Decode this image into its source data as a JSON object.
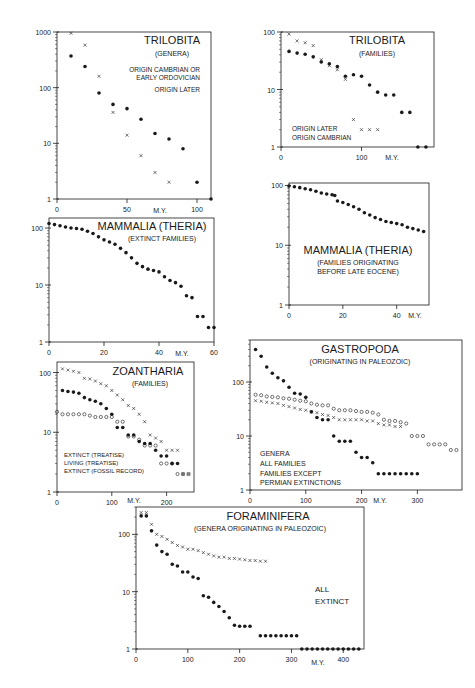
{
  "chart_data": [
    {
      "id": "trilobita-genera",
      "type": "scatter",
      "title": "TRILOBITA",
      "subtitle": "(GENERA)",
      "xlabel": "M.Y.",
      "ylabel": "",
      "yscale": "log",
      "ylim": [
        1,
        1000
      ],
      "xlim": [
        0,
        110
      ],
      "xticks": [
        "0",
        "50",
        "100"
      ],
      "yticks": [
        "1",
        "10",
        "100",
        "1000"
      ],
      "frame": {
        "x": 57,
        "y": 32,
        "w": 154,
        "h": 167
      },
      "legend": [
        {
          "marker": "x",
          "label": "ORIGIN CAMBRIAN OR EARLY ORDOVICIAN"
        },
        {
          "marker": "dot",
          "label": "ORIGIN LATER"
        }
      ],
      "series": [
        {
          "name": "ORIGIN CAMBRIAN OR EARLY ORDOVICIAN",
          "marker": "x",
          "x": [
            10,
            20,
            30,
            40,
            50,
            60,
            70,
            80
          ],
          "y": [
            950,
            580,
            160,
            36,
            14,
            6,
            3,
            2
          ]
        },
        {
          "name": "ORIGIN LATER",
          "marker": "dot",
          "x": [
            10,
            20,
            30,
            40,
            50,
            60,
            70,
            80,
            90,
            100,
            110
          ],
          "y": [
            370,
            240,
            80,
            50,
            42,
            27,
            15,
            12,
            8,
            2,
            1
          ]
        }
      ]
    },
    {
      "id": "trilobita-families",
      "type": "scatter",
      "title": "TRILOBITA",
      "subtitle": "(FAMILIES)",
      "xlabel": "M.Y.",
      "yscale": "log",
      "ylim": [
        1,
        100
      ],
      "xlim": [
        0,
        190
      ],
      "xticks": [
        "0",
        "100"
      ],
      "yticks": [
        "1",
        "10",
        "100"
      ],
      "frame": {
        "x": 281,
        "y": 32,
        "w": 153,
        "h": 115
      },
      "legend": [
        {
          "marker": "dot",
          "label": "ORIGIN LATER"
        },
        {
          "marker": "x",
          "label": "ORIGIN CAMBRIAN"
        }
      ],
      "series": [
        {
          "name": "ORIGIN LATER",
          "marker": "dot",
          "x": [
            10,
            20,
            30,
            40,
            50,
            60,
            70,
            80,
            90,
            100,
            110,
            120,
            130,
            140,
            150,
            160,
            170,
            180
          ],
          "y": [
            46,
            43,
            41,
            37,
            30,
            28,
            25,
            17,
            18,
            17,
            12,
            9,
            8,
            8,
            4,
            4,
            1,
            1
          ]
        },
        {
          "name": "ORIGIN CAMBRIAN",
          "marker": "x",
          "x": [
            10,
            20,
            30,
            40,
            50,
            60,
            70,
            80,
            90,
            100,
            110,
            120
          ],
          "y": [
            92,
            70,
            65,
            58,
            33,
            26,
            22,
            15,
            3,
            2,
            2,
            2
          ]
        }
      ]
    },
    {
      "id": "mammalia-extinct",
      "type": "scatter",
      "title": "MAMMALIA (THERIA)",
      "subtitle": "(EXTINCT FAMILIES)",
      "xlabel": "M.Y.",
      "yscale": "log",
      "ylim": [
        1,
        150
      ],
      "xlim": [
        0,
        60
      ],
      "xticks": [
        "0",
        "20",
        "40",
        "60"
      ],
      "yticks": [
        "1",
        "10",
        "100"
      ],
      "frame": {
        "x": 49,
        "y": 218,
        "w": 165,
        "h": 124
      },
      "series": [
        {
          "name": "EXTINCT FAMILIES",
          "marker": "dot",
          "x": [
            0,
            2,
            4,
            6,
            8,
            10,
            12,
            14,
            16,
            18,
            20,
            22,
            24,
            26,
            28,
            30,
            32,
            34,
            36,
            38,
            40,
            42,
            44,
            46,
            48,
            50,
            52,
            54,
            56,
            58,
            60
          ],
          "y": [
            120,
            115,
            110,
            104,
            100,
            98,
            95,
            88,
            80,
            70,
            62,
            57,
            52,
            44,
            37,
            30,
            24,
            21,
            19,
            18,
            17,
            14,
            12,
            11,
            9.5,
            6.5,
            6,
            2.8,
            2.8,
            1.8,
            1.8
          ]
        }
      ]
    },
    {
      "id": "mammalia-before-late-eocene",
      "type": "scatter",
      "title": "MAMMALIA (THERIA)",
      "subtitle": "(FAMILIES ORIGINATING BEFORE LATE EOCENE)",
      "xlabel": "M.Y.",
      "yscale": "log",
      "ylim": [
        1,
        110
      ],
      "xlim": [
        0,
        52
      ],
      "xticks": [
        "0",
        "20",
        "40"
      ],
      "yticks": [
        "1",
        "10",
        "100"
      ],
      "frame": {
        "x": 289,
        "y": 183,
        "w": 140,
        "h": 122
      },
      "series": [
        {
          "name": "FAMILIES ORIGINATING BEFORE LATE EOCENE",
          "marker": "dot",
          "x": [
            0,
            2,
            4,
            6,
            8,
            10,
            12,
            14,
            16,
            17,
            18,
            20,
            22,
            24,
            26,
            28,
            30,
            32,
            34,
            36,
            38,
            40,
            42,
            44,
            46,
            48,
            50
          ],
          "y": [
            98,
            95,
            92,
            88,
            85,
            80,
            75,
            72,
            70,
            68,
            55,
            52,
            48,
            44,
            40,
            35,
            32,
            29,
            27,
            25,
            24,
            23,
            22,
            20,
            19,
            18,
            17
          ]
        }
      ]
    },
    {
      "id": "zoantharia-families",
      "type": "scatter",
      "title": "ZOANTHARIA",
      "subtitle": "(FAMILIES)",
      "xlabel": "M.Y.",
      "yscale": "log",
      "ylim": [
        1,
        150
      ],
      "xlim": [
        0,
        250
      ],
      "xticks": [
        "0",
        "100",
        "200"
      ],
      "yticks": [
        "1",
        "10",
        "100"
      ],
      "frame": {
        "x": 57,
        "y": 362,
        "w": 137,
        "h": 130
      },
      "legend": [
        {
          "marker": "dot",
          "label": "EXTINCT (TREATISE)"
        },
        {
          "marker": "o",
          "label": "LIVING (TREATISE)"
        },
        {
          "marker": "x",
          "label": "EXTINCT (FOSSIL RECORD)"
        }
      ],
      "series": [
        {
          "name": "EXTINCT (TREATISE)",
          "marker": "dot",
          "x": [
            10,
            20,
            30,
            40,
            50,
            60,
            70,
            80,
            90,
            100,
            110,
            120,
            130,
            140,
            150,
            160,
            170,
            180,
            190,
            200,
            210,
            220
          ],
          "y": [
            50,
            48,
            47,
            45,
            38,
            35,
            33,
            30,
            25,
            20,
            12,
            12,
            9,
            9,
            7,
            6.5,
            6.5,
            5,
            4,
            4,
            3,
            3
          ]
        },
        {
          "name": "LIVING (TREATISE)",
          "marker": "o",
          "x": [
            0,
            10,
            20,
            30,
            40,
            50,
            60,
            70,
            80,
            90,
            100,
            110,
            120,
            130,
            140,
            150,
            160,
            170,
            180,
            190,
            200,
            210,
            220,
            230,
            240
          ],
          "y": [
            22,
            20,
            20,
            20,
            20,
            20,
            19,
            18,
            18,
            18,
            18,
            15,
            15,
            8.5,
            8.5,
            7.5,
            6,
            6,
            6,
            3,
            3,
            3,
            2,
            2,
            2
          ]
        },
        {
          "name": "EXTINCT (FOSSIL RECORD)",
          "marker": "x",
          "x": [
            10,
            20,
            30,
            40,
            50,
            60,
            70,
            80,
            90,
            100,
            110,
            120,
            130,
            140,
            150,
            160,
            170,
            180,
            190,
            200,
            210,
            220,
            230,
            240
          ],
          "y": [
            115,
            110,
            105,
            100,
            80,
            78,
            72,
            65,
            60,
            50,
            42,
            35,
            28,
            25,
            20,
            15,
            9,
            8,
            7,
            5,
            5,
            5,
            2,
            2
          ]
        }
      ]
    },
    {
      "id": "gastropoda-paleozoic",
      "type": "scatter",
      "title": "GASTROPODA",
      "subtitle": "(ORIGINATING IN PALEOZOIC)",
      "xlabel": "M.Y.",
      "yscale": "log",
      "ylim": [
        1,
        600
      ],
      "xlim": [
        0,
        380
      ],
      "xticks": [
        "0",
        "100",
        "200",
        "300"
      ],
      "yticks": [
        "1",
        "10",
        "100"
      ],
      "frame": {
        "x": 250,
        "y": 340,
        "w": 212,
        "h": 150
      },
      "legend": [
        {
          "marker": "dot",
          "label": "GENERA"
        },
        {
          "marker": "o",
          "label": "ALL FAMILIES"
        },
        {
          "marker": "x",
          "label": "FAMILIES EXCEPT PERMIAN EXTINCTIONS"
        }
      ],
      "series": [
        {
          "name": "GENERA",
          "marker": "dot",
          "x": [
            10,
            20,
            30,
            40,
            50,
            60,
            70,
            80,
            90,
            100,
            110,
            120,
            130,
            140,
            150,
            160,
            170,
            180,
            190,
            200,
            210,
            220,
            230,
            240,
            250,
            260,
            270,
            280,
            290,
            300
          ],
          "y": [
            400,
            300,
            190,
            145,
            120,
            105,
            80,
            62,
            60,
            52,
            28,
            22,
            20,
            20,
            10,
            8,
            8,
            8,
            5,
            4,
            4,
            3.2,
            2,
            2,
            2,
            2,
            2,
            2,
            2,
            2
          ]
        },
        {
          "name": "ALL FAMILIES",
          "marker": "o",
          "x": [
            10,
            20,
            30,
            40,
            50,
            60,
            70,
            80,
            90,
            100,
            110,
            120,
            130,
            140,
            150,
            160,
            170,
            180,
            190,
            200,
            210,
            220,
            230,
            240,
            250,
            260,
            270,
            280,
            290,
            300,
            310,
            320,
            330,
            340,
            350,
            360,
            370
          ],
          "y": [
            58,
            57,
            54,
            53,
            52,
            50,
            49,
            47,
            45,
            44,
            40,
            38,
            37,
            37,
            32,
            30,
            30,
            30,
            29,
            28,
            28,
            27,
            25,
            20,
            19,
            19,
            18,
            17,
            10,
            10,
            10,
            7,
            7,
            7,
            7,
            5.5,
            5.5
          ]
        },
        {
          "name": "FAMILIES EXCEPT PERMIAN EXTINCTIONS",
          "marker": "x",
          "x": [
            10,
            20,
            30,
            40,
            50,
            60,
            70,
            80,
            90,
            100,
            110,
            120,
            130,
            140,
            150,
            160,
            170,
            180,
            190,
            200,
            210,
            220,
            230,
            240,
            250,
            260,
            270
          ],
          "y": [
            45,
            44,
            42,
            41,
            40,
            37,
            35,
            33,
            31,
            30,
            28,
            27,
            25,
            24,
            22,
            20,
            20,
            20,
            20,
            20,
            19,
            19,
            17,
            16,
            16,
            15,
            15
          ]
        }
      ]
    },
    {
      "id": "foraminifera-paleozoic",
      "type": "scatter",
      "title": "FORAMINIFERA",
      "subtitle": "(GENERA ORIGINATING IN PALEOZOIC)",
      "xlabel": "M.Y.",
      "yscale": "log",
      "ylim": [
        1,
        300
      ],
      "xlim": [
        0,
        440
      ],
      "xticks": [
        "0",
        "100",
        "200",
        "300",
        "400"
      ],
      "yticks": [
        "1",
        "10",
        "100"
      ],
      "frame": {
        "x": 136,
        "y": 507,
        "w": 228,
        "h": 142
      },
      "legend": [
        {
          "marker": "x",
          "label": "ALL"
        },
        {
          "marker": "dot",
          "label": "EXTINCT"
        }
      ],
      "series": [
        {
          "name": "ALL",
          "marker": "x",
          "x": [
            10,
            20,
            30,
            40,
            50,
            60,
            70,
            80,
            90,
            100,
            110,
            120,
            130,
            140,
            150,
            160,
            170,
            180,
            190,
            200,
            210,
            220,
            230,
            240,
            250
          ],
          "y": [
            240,
            240,
            150,
            100,
            92,
            82,
            72,
            64,
            60,
            55,
            55,
            52,
            48,
            45,
            42,
            40,
            40,
            38,
            38,
            37,
            36,
            35,
            35,
            34,
            34
          ]
        },
        {
          "name": "EXTINCT",
          "marker": "dot",
          "x": [
            10,
            20,
            30,
            40,
            50,
            60,
            70,
            80,
            90,
            100,
            110,
            120,
            130,
            140,
            150,
            160,
            170,
            180,
            190,
            200,
            210,
            220,
            240,
            250,
            260,
            270,
            280,
            290,
            300,
            310,
            320,
            330,
            340,
            350,
            360,
            370,
            380,
            390,
            400,
            410,
            420,
            430
          ],
          "y": [
            210,
            210,
            115,
            65,
            50,
            45,
            30,
            28,
            22,
            22,
            18,
            17,
            8.5,
            8,
            6.5,
            5.5,
            4.5,
            3.5,
            2.6,
            2.5,
            2.5,
            2.5,
            1.7,
            1.7,
            1.7,
            1.7,
            1.7,
            1.7,
            1.7,
            1.7,
            1,
            1,
            1,
            1,
            1,
            1,
            1,
            1,
            1,
            1,
            1,
            1
          ]
        }
      ]
    }
  ],
  "panels": {
    "trilobita_genera": {
      "title": "TRILOBITA",
      "subtitle": "(GENERA)",
      "legend1a": "ORIGIN CAMBRIAN OR",
      "legend1b": "EARLY ORDOVICIAN",
      "legend2": "ORIGIN LATER",
      "xunit": "M.Y."
    },
    "trilobita_families": {
      "title": "TRILOBITA",
      "subtitle": "(FAMILIES)",
      "legend1": "ORIGIN LATER",
      "legend2": "ORIGIN CAMBRIAN",
      "xunit": "M.Y."
    },
    "mammalia_extinct": {
      "title": "MAMMALIA (THERIA)",
      "subtitle": "(EXTINCT FAMILIES)",
      "xunit": "M.Y."
    },
    "mammalia_eocene": {
      "title": "MAMMALIA (THERIA)",
      "subtitle1": "(FAMILIES ORIGINATING",
      "subtitle2": "BEFORE LATE EOCENE)",
      "xunit": "M.Y."
    },
    "zoantharia": {
      "title": "ZOANTHARIA",
      "subtitle": "(FAMILIES)",
      "legend1": "EXTINCT (TREATISE)",
      "legend2": "LIVING (TREATISE)",
      "legend3": "EXTINCT (FOSSIL RECORD)",
      "xunit": "M.Y."
    },
    "gastropoda": {
      "title": "GASTROPODA",
      "subtitle": "(ORIGINATING IN PALEOZOIC)",
      "legend1": "GENERA",
      "legend2": "ALL FAMILIES",
      "legend3a": "FAMILIES EXCEPT",
      "legend3b": "PERMIAN EXTINCTIONS",
      "xunit": "M.Y."
    },
    "foraminifera": {
      "title": "FORAMINIFERA",
      "subtitle": "(GENERA ORIGINATING IN PALEOZOIC)",
      "legend1": "ALL",
      "legend2": "EXTINCT",
      "xunit": "M.Y."
    }
  }
}
